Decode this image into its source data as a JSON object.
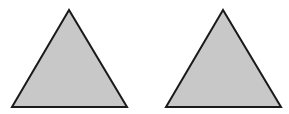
{
  "figure": {
    "width": 289,
    "height": 114,
    "background": "#ffffff",
    "shapes": [
      {
        "type": "triangle",
        "name": "left-triangle",
        "points": [
          [
            69,
            10
          ],
          [
            12,
            107
          ],
          [
            127,
            107
          ]
        ],
        "fill": "#c8c8c8",
        "stroke": "#1a1a1a",
        "stroke_width": 2
      },
      {
        "type": "triangle",
        "name": "right-triangle",
        "points": [
          [
            223,
            10
          ],
          [
            166,
            107
          ],
          [
            281,
            107
          ]
        ],
        "fill": "#c8c8c8",
        "stroke": "#1a1a1a",
        "stroke_width": 2
      }
    ]
  }
}
